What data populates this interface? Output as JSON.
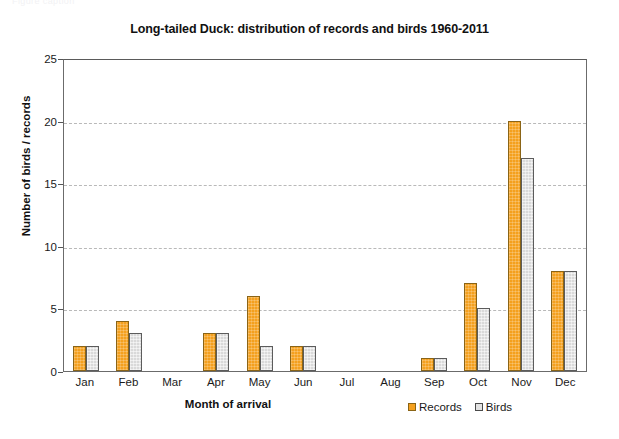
{
  "artifact": {
    "top_text": "Figure caption"
  },
  "chart_data": {
    "type": "bar",
    "title": "Long-tailed Duck: distribution of records and birds 1960-2011",
    "xlabel": "Month of arrival",
    "ylabel": "Number of birds / records",
    "categories": [
      "Jan",
      "Feb",
      "Mar",
      "Apr",
      "May",
      "Jun",
      "Jul",
      "Aug",
      "Sep",
      "Oct",
      "Nov",
      "Dec"
    ],
    "series": [
      {
        "name": "Records",
        "color": "#f4a01e",
        "values": [
          2,
          4,
          0,
          3,
          6,
          2,
          0,
          0,
          1,
          7,
          20,
          8
        ]
      },
      {
        "name": "Birds",
        "color": "#d9d9d9",
        "values": [
          2,
          3,
          0,
          3,
          2,
          2,
          0,
          0,
          1,
          5,
          17,
          8
        ]
      }
    ],
    "ylim": [
      0,
      25
    ],
    "yticks": [
      0,
      5,
      10,
      15,
      20,
      25
    ],
    "grid": "horizontal-dashed",
    "legend_position": "bottom-right"
  }
}
